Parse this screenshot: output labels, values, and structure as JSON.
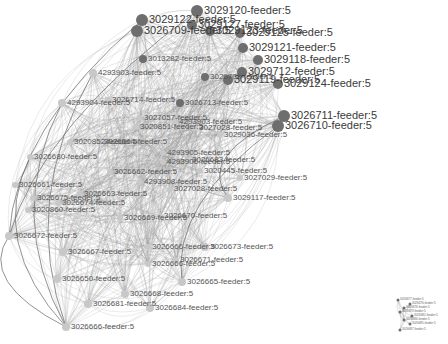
{
  "graph": {
    "type": "network",
    "edge_color": "#9a9a9a",
    "node_color_dark": "#6e6e6e",
    "node_color_light": "#c8c8c8",
    "main_cluster": {
      "nodes": [
        {
          "id": "n1",
          "label": "3029120-feeder:5",
          "x": 197,
          "y": 11,
          "r": 6,
          "tone": "dark",
          "size": "big"
        },
        {
          "id": "n2",
          "label": "3029122-feeder:5",
          "x": 142,
          "y": 20,
          "r": 6,
          "tone": "dark",
          "size": "big"
        },
        {
          "id": "n3",
          "label": "3029127-feeder:5",
          "x": 192,
          "y": 25,
          "r": 5,
          "tone": "dark",
          "size": "big"
        },
        {
          "id": "n4",
          "label": "3026709-feeder:5",
          "x": 137,
          "y": 31,
          "r": 6,
          "tone": "dark",
          "size": "big"
        },
        {
          "id": "n5",
          "label": "3029123-feeder:5",
          "x": 210,
          "y": 31,
          "r": 5,
          "tone": "dark",
          "size": "big"
        },
        {
          "id": "n6",
          "label": "3029125-feeder:5",
          "x": 240,
          "y": 33,
          "r": 5,
          "tone": "dark",
          "size": "big"
        },
        {
          "id": "n7",
          "label": "3029121-feeder:5",
          "x": 243,
          "y": 48,
          "r": 5,
          "tone": "dark",
          "size": "big"
        },
        {
          "id": "n8",
          "label": "3013282-feeder:5",
          "x": 143,
          "y": 59,
          "r": 4,
          "tone": "dark",
          "size": "med"
        },
        {
          "id": "n9",
          "label": "3029118-feeder:5",
          "x": 258,
          "y": 60,
          "r": 5,
          "tone": "dark",
          "size": "big"
        },
        {
          "id": "n10",
          "label": "3029712-feeder:5",
          "x": 242,
          "y": 72,
          "r": 5,
          "tone": "dark",
          "size": "big"
        },
        {
          "id": "n11",
          "label": "4293903-feeder:5",
          "x": 93,
          "y": 73,
          "r": 4,
          "tone": "light",
          "size": "med"
        },
        {
          "id": "n12",
          "label": "3026708-feeder:5",
          "x": 205,
          "y": 77,
          "r": 4,
          "tone": "dark",
          "size": "med"
        },
        {
          "id": "n13",
          "label": "3029119-feeder:5",
          "x": 228,
          "y": 80,
          "r": 5,
          "tone": "dark",
          "size": "big"
        },
        {
          "id": "n14",
          "label": "3029124-feeder:5",
          "x": 278,
          "y": 84,
          "r": 5,
          "tone": "dark",
          "size": "big"
        },
        {
          "id": "n15",
          "label": "4293904-feeder:5",
          "x": 62,
          "y": 103,
          "r": 4,
          "tone": "light",
          "size": "med"
        },
        {
          "id": "n16",
          "label": "3026714-feeder:5",
          "x": 108,
          "y": 100,
          "r": 3,
          "tone": "light",
          "size": "med"
        },
        {
          "id": "n17",
          "label": "3026713-feeder:5",
          "x": 180,
          "y": 103,
          "r": 4,
          "tone": "dark",
          "size": "med"
        },
        {
          "id": "n18",
          "label": "3026711-feeder:5",
          "x": 284,
          "y": 116,
          "r": 6,
          "tone": "dark",
          "size": "big"
        },
        {
          "id": "n19",
          "label": "3027057-feeder:5",
          "x": 140,
          "y": 118,
          "r": 3,
          "tone": "light",
          "size": "med"
        },
        {
          "id": "n20",
          "label": "3020851-feeder:5",
          "x": 136,
          "y": 127,
          "r": 3,
          "tone": "light",
          "size": "med"
        },
        {
          "id": "n21",
          "label": "4293903-feeder:5",
          "x": 175,
          "y": 122,
          "r": 3,
          "tone": "light",
          "size": "med"
        },
        {
          "id": "n22",
          "label": "3027028-feeder:5",
          "x": 195,
          "y": 128,
          "r": 3,
          "tone": "light",
          "size": "med"
        },
        {
          "id": "n23",
          "label": "3026710-feeder:5",
          "x": 278,
          "y": 126,
          "r": 6,
          "tone": "dark",
          "size": "big"
        },
        {
          "id": "n24",
          "label": "3029036-feeder:5",
          "x": 220,
          "y": 135,
          "r": 3,
          "tone": "light",
          "size": "med"
        },
        {
          "id": "n25",
          "label": "3020852-feeder:5",
          "x": 70,
          "y": 142,
          "r": 3,
          "tone": "light",
          "size": "med"
        },
        {
          "id": "n26",
          "label": "3026664-feeder:5",
          "x": 100,
          "y": 142,
          "r": 3,
          "tone": "light",
          "size": "med"
        },
        {
          "id": "n27",
          "label": "3026680-feeder:5",
          "x": 30,
          "y": 157,
          "r": 3,
          "tone": "light",
          "size": "med"
        },
        {
          "id": "n28",
          "label": "4293905-feeder:5",
          "x": 163,
          "y": 153,
          "r": 3,
          "tone": "light",
          "size": "med"
        },
        {
          "id": "n29",
          "label": "3026683-feeder:5",
          "x": 188,
          "y": 160,
          "r": 3,
          "tone": "light",
          "size": "med"
        },
        {
          "id": "n30",
          "label": "4293906-feeder:5",
          "x": 163,
          "y": 162,
          "r": 3,
          "tone": "light",
          "size": "med"
        },
        {
          "id": "n31",
          "label": "3026662-feeder:5",
          "x": 110,
          "y": 172,
          "r": 3,
          "tone": "light",
          "size": "med"
        },
        {
          "id": "n32",
          "label": "3020445-feeder:5",
          "x": 200,
          "y": 171,
          "r": 3,
          "tone": "light",
          "size": "med"
        },
        {
          "id": "n33",
          "label": "3027029-feeder:5",
          "x": 240,
          "y": 178,
          "r": 3,
          "tone": "light",
          "size": "med"
        },
        {
          "id": "n34",
          "label": "3026661-feeder:5",
          "x": 15,
          "y": 185,
          "r": 3,
          "tone": "light",
          "size": "med"
        },
        {
          "id": "n35",
          "label": "4293908-feeder:5",
          "x": 140,
          "y": 182,
          "r": 3,
          "tone": "light",
          "size": "med"
        },
        {
          "id": "n36",
          "label": "3026675-feeder:5",
          "x": 33,
          "y": 198,
          "r": 3,
          "tone": "light",
          "size": "med"
        },
        {
          "id": "n37",
          "label": "3026663-feeder:5",
          "x": 80,
          "y": 194,
          "r": 3,
          "tone": "light",
          "size": "med"
        },
        {
          "id": "n38",
          "label": "3027028-feeder:5",
          "x": 170,
          "y": 189,
          "r": 3,
          "tone": "light",
          "size": "med"
        },
        {
          "id": "n39",
          "label": "3029117-feeder:5",
          "x": 228,
          "y": 198,
          "r": 4,
          "tone": "light",
          "size": "med"
        },
        {
          "id": "n40",
          "label": "3026674-feeder:5",
          "x": 58,
          "y": 203,
          "r": 3,
          "tone": "light",
          "size": "med"
        },
        {
          "id": "n41",
          "label": "3020860-feeder:5",
          "x": 28,
          "y": 210,
          "r": 3,
          "tone": "light",
          "size": "med"
        },
        {
          "id": "n42",
          "label": "3026669-feeder:5",
          "x": 120,
          "y": 218,
          "r": 3,
          "tone": "light",
          "size": "med"
        },
        {
          "id": "n43",
          "label": "3026670-feeder:5",
          "x": 160,
          "y": 216,
          "r": 3,
          "tone": "light",
          "size": "med"
        },
        {
          "id": "n44",
          "label": "3026672-feeder:5",
          "x": 9,
          "y": 236,
          "r": 4,
          "tone": "light",
          "size": "med"
        },
        {
          "id": "n45",
          "label": "3026666-feeder:5",
          "x": 148,
          "y": 247,
          "r": 3,
          "tone": "light",
          "size": "med"
        },
        {
          "id": "n46",
          "label": "3026673-feeder:5",
          "x": 205,
          "y": 247,
          "r": 4,
          "tone": "light",
          "size": "med"
        },
        {
          "id": "n47",
          "label": "3026667-feeder:5",
          "x": 63,
          "y": 252,
          "r": 4,
          "tone": "light",
          "size": "med"
        },
        {
          "id": "n48",
          "label": "3026671-feeder:5",
          "x": 176,
          "y": 260,
          "r": 3,
          "tone": "light",
          "size": "med"
        },
        {
          "id": "n49",
          "label": "3026666-feeder:5",
          "x": 148,
          "y": 264,
          "r": 3,
          "tone": "light",
          "size": "med"
        },
        {
          "id": "n50",
          "label": "3026665-feeder:5",
          "x": 182,
          "y": 282,
          "r": 4,
          "tone": "light",
          "size": "med"
        },
        {
          "id": "n51",
          "label": "3026650-feeder:5",
          "x": 57,
          "y": 279,
          "r": 4,
          "tone": "light",
          "size": "med"
        },
        {
          "id": "n52",
          "label": "3026668-feeder:5",
          "x": 125,
          "y": 294,
          "r": 4,
          "tone": "light",
          "size": "med"
        },
        {
          "id": "n53",
          "label": "3026684-feeder:5",
          "x": 150,
          "y": 308,
          "r": 4,
          "tone": "light",
          "size": "med"
        },
        {
          "id": "n54",
          "label": "3026681-feeder:5",
          "x": 88,
          "y": 304,
          "r": 4,
          "tone": "light",
          "size": "med"
        },
        {
          "id": "n55",
          "label": "3026666-feeder:5",
          "x": 66,
          "y": 327,
          "r": 4,
          "tone": "light",
          "size": "med"
        }
      ]
    },
    "small_cluster": {
      "nodes": [
        {
          "id": "s1",
          "label": "3026677-feeder:5",
          "x": 398,
          "y": 300
        },
        {
          "id": "s2",
          "label": "3026676-feeder:5",
          "x": 410,
          "y": 304
        },
        {
          "id": "s3",
          "label": "3026678-feeder:5",
          "x": 404,
          "y": 308
        },
        {
          "id": "s4",
          "label": "3026679-feeder:5",
          "x": 400,
          "y": 312
        },
        {
          "id": "s5",
          "label": "3026682-feeder:5",
          "x": 412,
          "y": 316
        },
        {
          "id": "s6",
          "label": "3026686-feeder:5",
          "x": 404,
          "y": 320
        },
        {
          "id": "s7",
          "label": "3026685-feeder:5",
          "x": 410,
          "y": 324
        },
        {
          "id": "s8",
          "label": "3026687-feeder:5",
          "x": 400,
          "y": 330
        }
      ]
    }
  }
}
